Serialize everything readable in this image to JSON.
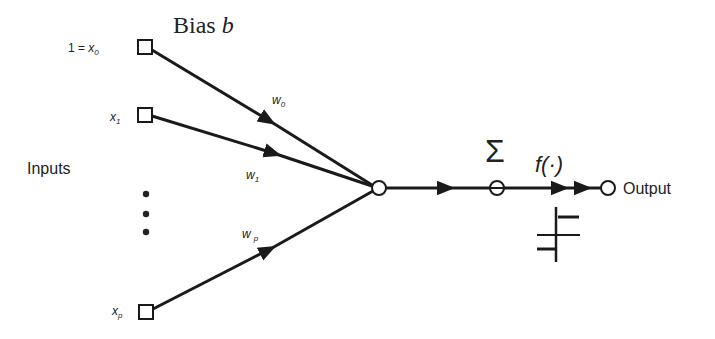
{
  "diagram": {
    "type": "perceptron",
    "bias_label": "Bias",
    "bias_symbol": "b",
    "inputs_label": "Inputs",
    "input_nodes": [
      {
        "prefix": "1 = ",
        "label": "x",
        "sub": "0"
      },
      {
        "prefix": "",
        "label": "x",
        "sub": "1"
      },
      {
        "prefix": "",
        "label": "x",
        "sub": "p"
      }
    ],
    "weights": [
      {
        "label": "w",
        "sub": "0"
      },
      {
        "label": "w",
        "sub": "1"
      },
      {
        "label": "w",
        "sub": "p"
      }
    ],
    "sum_symbol": "Σ",
    "activation_label": "f(·)",
    "output_label": "Output",
    "activation_icon": "step-function-icon"
  }
}
